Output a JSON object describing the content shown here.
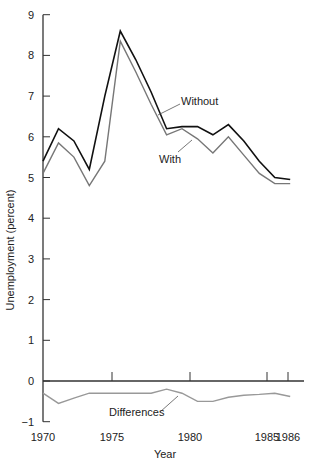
{
  "chart_data": {
    "type": "line",
    "title": "",
    "xlabel": "Year",
    "ylabel": "Unemployment (percent)",
    "ylim": [
      -1,
      9
    ],
    "yticks": [
      -1,
      0,
      1,
      2,
      3,
      4,
      5,
      6,
      7,
      8,
      9
    ],
    "xticks": [
      "1970",
      "1975",
      "1980",
      "1985",
      "1986"
    ],
    "grid": false,
    "legend": "inline annotations",
    "annotations": [
      "Without",
      "With",
      "Differences"
    ],
    "x": [
      1970,
      1971,
      1972,
      1973,
      1974,
      1975,
      1976,
      1977,
      1978,
      1979,
      1980,
      1981,
      1982,
      1983,
      1984,
      1985,
      1986
    ],
    "series": [
      {
        "name": "Without",
        "color": "#111111",
        "values": [
          5.4,
          6.2,
          5.9,
          5.2,
          7.0,
          8.6,
          7.9,
          7.1,
          6.2,
          6.25,
          6.25,
          6.05,
          6.3,
          5.9,
          5.4,
          5.0,
          4.95
        ]
      },
      {
        "name": "With",
        "color": "#777777",
        "values": [
          5.1,
          5.85,
          5.5,
          4.8,
          5.4,
          8.35,
          7.6,
          6.8,
          6.05,
          6.2,
          5.95,
          5.6,
          6.0,
          5.55,
          5.1,
          4.85,
          4.85
        ]
      },
      {
        "name": "Differences",
        "color": "#999999",
        "values": [
          -0.3,
          -0.55,
          -0.42,
          -0.3,
          -0.3,
          -0.3,
          -0.3,
          -0.3,
          -0.2,
          -0.3,
          -0.5,
          -0.5,
          -0.4,
          -0.35,
          -0.33,
          -0.3,
          -0.38
        ]
      }
    ]
  }
}
